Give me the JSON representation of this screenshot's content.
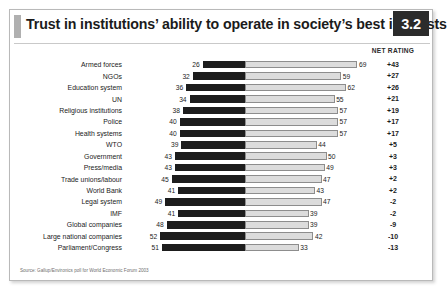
{
  "figure": {
    "title": "Trust in institutions’ ability to operate in society’s best interests",
    "badge": "3.2",
    "net_header": "NET RATING",
    "source": "Source: Gallup/Environics poll for World Economic Forum 2003"
  },
  "colors": {
    "distrust_bar": "#1d1d1d",
    "trust_bar": "#dcdcdc",
    "trust_bar_border": "#8d8d8d",
    "badge_background": "#2b2b2b",
    "badge_text": "#ffffff",
    "title_accent": "#b0b0b0",
    "text": "#1b1b1b",
    "source_text": "#6e6e6e"
  },
  "chart_data": {
    "type": "bar",
    "subtype": "diverging-horizontal-stacked",
    "title": "Trust in institutions’ ability to operate in society’s best interests",
    "xlabel": "",
    "ylabel": "",
    "grid": false,
    "legend_position": "none",
    "axis_center_note": "Bars diverge from a common center line: dark segment extends left (distrust %), light segment extends right (trust %)",
    "categories": [
      "Armed forces",
      "NGOs",
      "Education system",
      "UN",
      "Religious institutions",
      "Police",
      "Health systems",
      "WTO",
      "Government",
      "Press/media",
      "Trade unions/labour",
      "World Bank",
      "Legal system",
      "IMF",
      "Global companies",
      "Large national companies",
      "Parliament/Congress"
    ],
    "series": [
      {
        "name": "Distrust",
        "side": "left",
        "color": "#1d1d1d",
        "values": [
          26,
          32,
          36,
          34,
          38,
          40,
          40,
          39,
          43,
          43,
          45,
          41,
          49,
          41,
          48,
          52,
          51
        ]
      },
      {
        "name": "Trust",
        "side": "right",
        "color": "#dcdcdc",
        "values": [
          69,
          59,
          62,
          55,
          57,
          57,
          57,
          44,
          50,
          49,
          47,
          43,
          47,
          39,
          39,
          42,
          33
        ]
      }
    ],
    "net_rating": [
      "+43",
      "+27",
      "+26",
      "+21",
      "+19",
      "+17",
      "+17",
      "+5",
      "+3",
      "+3",
      "+2",
      "+2",
      "-2",
      "-2",
      "-9",
      "-10",
      "-13"
    ],
    "value_range": [
      0,
      70
    ]
  }
}
